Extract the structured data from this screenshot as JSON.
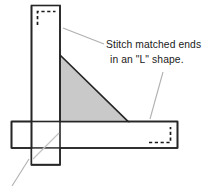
{
  "diagram": {
    "caption": {
      "line1": "Stitch matched ends",
      "line2": "in an \"L\" shape."
    },
    "colors": {
      "outline": "#262626",
      "fill": "#ffffff",
      "triangle_fill": "#c9c9c9",
      "leader_line": "#b0b0b0",
      "stitch_dash": "#1a1a1a",
      "background": "#ffffff",
      "text": "#1a1a1a"
    },
    "shapes": {
      "vertical_strip": {
        "label": "vertical fabric strip",
        "x": 31,
        "y": 5,
        "width": 29,
        "height": 160
      },
      "horizontal_strip": {
        "label": "horizontal fabric strip",
        "x": 11,
        "y": 121,
        "width": 167,
        "height": 27
      },
      "triangle": {
        "label": "shaded seam allowance triangle",
        "apex_x": 60,
        "apex_y": 55,
        "base_x": 128,
        "base_y": 121
      }
    },
    "stitch_lines": [
      {
        "name": "top-stitch-corner",
        "orientation": "upper-left",
        "shape": "L"
      },
      {
        "name": "right-stitch-corner",
        "orientation": "lower-right",
        "shape": "L"
      }
    ],
    "leader_lines": [
      {
        "name": "leader-to-top-stitch",
        "x1": 63,
        "y1": 28,
        "x2": 104,
        "y2": 44
      },
      {
        "name": "leader-to-right-stitch",
        "x1": 163,
        "y1": 72,
        "x2": 150,
        "y2": 119
      },
      {
        "name": "leader-to-intersection",
        "x1": 12,
        "y1": 186,
        "x2": 29,
        "y2": 159
      },
      {
        "name": "leader-through-crossing",
        "x1": 35,
        "y1": 157,
        "x2": 72,
        "y2": 120
      }
    ]
  }
}
